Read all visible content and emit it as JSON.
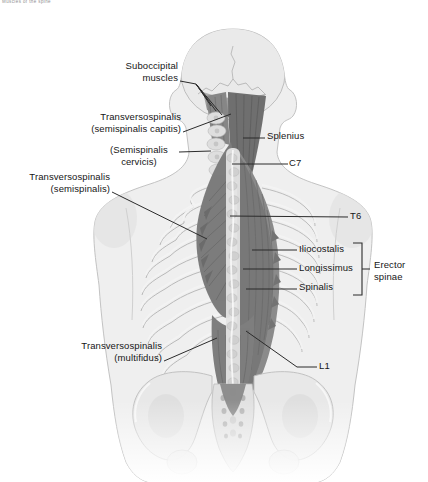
{
  "page": {
    "top_caption": "Muscles of the spine"
  },
  "figure": {
    "labels": {
      "suboccipital": "Suboccipital\nmuscles",
      "transversospinalis_capitis": "Transversospinalis\n(semispinalis capitis)",
      "semispinalis_cervicis": "(Semispinalis\ncervicis)",
      "splenius": "Splenius",
      "c7": "C7",
      "t6": "T6",
      "iliocostalis": "Iliocostalis",
      "longissimus": "Longissimus",
      "spinalis": "Spinalis",
      "erector_spinae": "Erector\nspinae",
      "l1": "L1",
      "transversospinalis_semispinalis": "Transversospinalis\n(semispinalis)",
      "transversospinalis_multifidus": "Transversospinalis\n(multifidus)"
    },
    "colors": {
      "background": "#ffffff",
      "label_text": "#161616",
      "leader_line": "#2b2b2b",
      "body_fill": "#efefef",
      "body_outline": "#c3c3c3",
      "muscle_dark": "#6f6f6f",
      "muscle_mid": "#808080",
      "bone_light": "#e6e6e6",
      "bone_outline": "#b6b6b6"
    }
  }
}
